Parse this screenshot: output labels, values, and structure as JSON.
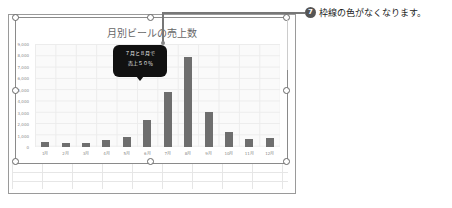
{
  "chart": {
    "title": "月別ビールの売上数",
    "callout": {
      "line1": "７月と８月で",
      "line2": "売上５０％"
    }
  },
  "annotation": {
    "step_number": "7",
    "text": "枠線の色がなくなります。"
  },
  "colors": {
    "bar": "#6e6e6e",
    "callout_bg": "#111111",
    "step_badge": "#555555"
  },
  "chart_data": {
    "type": "bar",
    "title": "月別ビールの売上数",
    "categories": [
      "1月",
      "2月",
      "3月",
      "4月",
      "5月",
      "6月",
      "7月",
      "8月",
      "9月",
      "10月",
      "11月",
      "12月"
    ],
    "values": [
      450,
      350,
      350,
      600,
      900,
      2400,
      4800,
      7900,
      3100,
      1300,
      700,
      750
    ],
    "xlabel": "",
    "ylabel": "",
    "ylim": [
      0,
      9000
    ],
    "yticks": [
      "0",
      "1,000",
      "2,000",
      "3,000",
      "4,000",
      "5,000",
      "6,000",
      "7,000",
      "8,000",
      "9,000"
    ],
    "grid": true,
    "legend": "none",
    "annotations": [
      "７月と８月で売上５０％"
    ]
  }
}
